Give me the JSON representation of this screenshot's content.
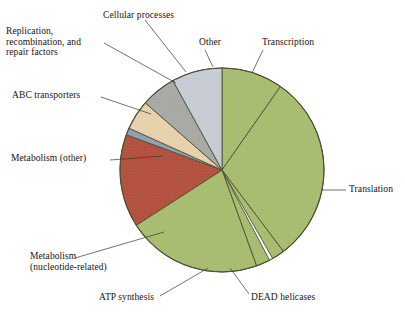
{
  "figure": {
    "title": "",
    "caption": ""
  },
  "chart_data": {
    "type": "pie",
    "title": "",
    "xlabel": "",
    "ylabel": "",
    "legend_position": "none",
    "grid": false,
    "labels_placement": "callout-leader-lines",
    "center": {
      "x": 222,
      "y": 170
    },
    "radius": 102,
    "start_angle_deg": 0,
    "direction": "clockwise",
    "categories": [
      "Transcription",
      "Translation",
      "DEAD helicases",
      "ATP synthesis",
      "Metabolism (nucleotide-related)",
      "Metabolism (other)",
      "ABC transporters",
      "Replication, recombination, and repair factors",
      "Cellular processes",
      "Other"
    ],
    "values": [
      9.7,
      30.0,
      2.0,
      2.2,
      21.4,
      14.7,
      1.1,
      4.7,
      5.6,
      8.1
    ],
    "units": "percent",
    "colors": [
      "#a9bd70",
      "#a9bd70",
      "#a9bd70",
      "#a9bd70",
      "#a9bd70",
      "#b3523f",
      "#8fa0b2",
      "#e8d2ae",
      "#a9a9a5",
      "#c8ccd4"
    ],
    "slices": [
      {
        "label": "Transcription",
        "start_deg": 0,
        "end_deg": 35,
        "color": "#a9bd70"
      },
      {
        "label": "Translation",
        "start_deg": 35,
        "end_deg": 143,
        "color": "#a9bd70"
      },
      {
        "label": "DEAD helicases",
        "start_deg": 143,
        "end_deg": 150.2,
        "color": "#a9bd70"
      },
      {
        "label": "ATP synthesis",
        "start_deg": 152.2,
        "end_deg": 160.2,
        "color": "#a9bd70"
      },
      {
        "label": "Metabolism (nucleotide-related)",
        "start_deg": 160.2,
        "end_deg": 237.2,
        "color": "#a9bd70"
      },
      {
        "label": "Metabolism (other)",
        "start_deg": 237.2,
        "end_deg": 290.2,
        "color": "#b3523f"
      },
      {
        "label": "ABC transporters",
        "start_deg": 290.2,
        "end_deg": 294.2,
        "color": "#8fa0b2"
      },
      {
        "label": "Replication, recombination, and repair factors",
        "start_deg": 294.2,
        "end_deg": 311.2,
        "color": "#e8d2ae"
      },
      {
        "label": "Cellular processes",
        "start_deg": 311.2,
        "end_deg": 331.2,
        "color": "#a9a9a5"
      },
      {
        "label": "Other",
        "start_deg": 331.2,
        "end_deg": 360,
        "color": "#c8ccd4"
      }
    ],
    "stroke_color": "#4c5136",
    "background": "#ffffff"
  },
  "labels": {
    "replication": {
      "line1": "Replication,",
      "line2": "recombination, and",
      "line3": "repair factors"
    },
    "cellular_processes": "Cellular processes",
    "other": "Other",
    "transcription": "Transcription",
    "abc_transporters": "ABC transporters",
    "metabolism_other": "Metabolism (other)",
    "metabolism_nucleotide": {
      "line1": "Metabolism",
      "line2": "(nucleotide-related)"
    },
    "atp_synthesis": "ATP synthesis",
    "dead_helicases": "DEAD helicases",
    "translation": "Translation"
  }
}
